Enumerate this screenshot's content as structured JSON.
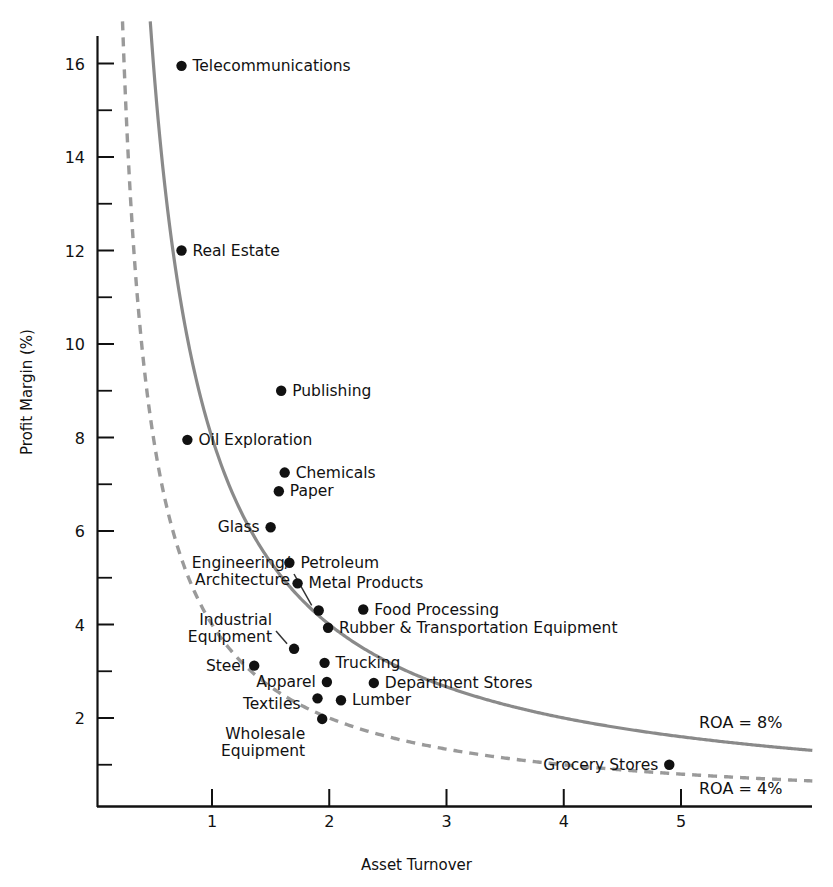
{
  "chart_data": {
    "type": "scatter",
    "title": "",
    "xlabel": "Asset Turnover",
    "ylabel": "Profit Margin (%)",
    "xlim": [
      0.18,
      6.2
    ],
    "ylim": [
      0.0,
      16.9
    ],
    "xticks": [
      1,
      2,
      3,
      4,
      5
    ],
    "xtick_labels": [
      "1",
      "2",
      "3",
      "4",
      "5"
    ],
    "yticks": [
      2,
      4,
      6,
      8,
      10,
      12,
      14,
      16
    ],
    "ytick_labels": [
      "2",
      "4",
      "6",
      "8",
      "10",
      "12",
      "14",
      "16"
    ],
    "yminor_ticks": [
      1,
      3,
      5,
      7,
      9,
      11,
      13,
      15
    ],
    "grid": false,
    "legend": "none",
    "points": [
      {
        "name": "Telecommunications",
        "x": 0.74,
        "y": 15.95,
        "label_side": "right"
      },
      {
        "name": "Real Estate",
        "x": 0.74,
        "y": 12.0,
        "label_side": "right"
      },
      {
        "name": "Publishing",
        "x": 1.59,
        "y": 9.0,
        "label_side": "right"
      },
      {
        "name": "Oil Exploration",
        "x": 0.79,
        "y": 7.95,
        "label_side": "right"
      },
      {
        "name": "Chemicals",
        "x": 1.62,
        "y": 7.25,
        "label_side": "right"
      },
      {
        "name": "Paper",
        "x": 1.57,
        "y": 6.85,
        "label_side": "right"
      },
      {
        "name": "Glass",
        "x": 1.5,
        "y": 6.08,
        "label_side": "left"
      },
      {
        "name": "Petroleum",
        "x": 1.66,
        "y": 5.32,
        "label_side": "right"
      },
      {
        "name": "Metal Products",
        "x": 1.73,
        "y": 4.88,
        "label_side": "right"
      },
      {
        "name": "Food Processing",
        "x": 2.29,
        "y": 4.32,
        "label_side": "right"
      },
      {
        "name": "Engineering/\nArchitecture",
        "x": 1.91,
        "y": 4.3,
        "label_side": "leader"
      },
      {
        "name": "Rubber & Transportation Equipment",
        "x": 1.99,
        "y": 3.93,
        "label_side": "right"
      },
      {
        "name": "Industrial\nEquipment",
        "x": 1.7,
        "y": 3.48,
        "label_side": "leader"
      },
      {
        "name": "Trucking",
        "x": 1.96,
        "y": 3.18,
        "label_side": "right"
      },
      {
        "name": "Steel",
        "x": 1.36,
        "y": 3.12,
        "label_side": "left"
      },
      {
        "name": "Apparel",
        "x": 1.98,
        "y": 2.77,
        "label_side": "left"
      },
      {
        "name": "Department Stores",
        "x": 2.38,
        "y": 2.75,
        "label_side": "right"
      },
      {
        "name": "Textiles",
        "x": 1.9,
        "y": 2.42,
        "label_side": "left"
      },
      {
        "name": "Lumber",
        "x": 2.1,
        "y": 2.38,
        "label_side": "right"
      },
      {
        "name": "Wholesale\nEquipment",
        "x": 1.94,
        "y": 1.98,
        "label_side": "left"
      },
      {
        "name": "Grocery Stores",
        "x": 4.9,
        "y": 1.0,
        "label_side": "left"
      }
    ],
    "curves": [
      {
        "name": "ROA = 8%",
        "roa": 8,
        "style": "solid",
        "color": "#8a8a8a",
        "label": "ROA = 8%"
      },
      {
        "name": "ROA = 4%",
        "roa": 4,
        "style": "dashed",
        "color": "#9a9a9a",
        "label": "ROA = 4%"
      }
    ]
  },
  "annotations": {
    "roa8_label": "ROA = 8%",
    "roa4_label": "ROA = 4%"
  }
}
